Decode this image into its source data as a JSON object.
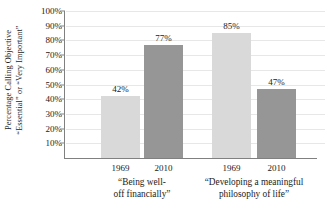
{
  "chart_data": {
    "type": "bar",
    "title": "",
    "subtitle": "",
    "xlabel": "",
    "ylabel_lines": [
      "Percentage Calling Objective",
      "“Essential” or “Very Important”"
    ],
    "ylim": [
      0,
      100
    ],
    "ytick_values": [
      100,
      90,
      80,
      70,
      60,
      50,
      40,
      30,
      20,
      10
    ],
    "ytick_labels": [
      "100%",
      "90%",
      "80%",
      "70%",
      "60%",
      "50%",
      "40%",
      "30%",
      "20%",
      "10%"
    ],
    "grid": true,
    "legend": "none",
    "categories": [
      {
        "lines": [
          "“Being well-",
          "off financially”"
        ],
        "text": "“Being well-off financially”"
      },
      {
        "lines": [
          "“Developing a meaningful",
          "philosophy of life”"
        ],
        "text": "“Developing a meaningful philosophy of life”"
      }
    ],
    "series": [
      {
        "name": "1969",
        "values": [
          42,
          85
        ],
        "color": "#d9d9d9"
      },
      {
        "name": "2010",
        "values": [
          77,
          47
        ],
        "color": "#969696"
      }
    ],
    "bars": [
      {
        "group": 0,
        "series": "1969",
        "value": 42,
        "label": "42%",
        "color": "#d9d9d9"
      },
      {
        "group": 0,
        "series": "2010",
        "value": 77,
        "label": "77%",
        "color": "#969696"
      },
      {
        "group": 1,
        "series": "1969",
        "value": 85,
        "label": "85%",
        "color": "#d9d9d9"
      },
      {
        "group": 1,
        "series": "2010",
        "value": 47,
        "label": "47%",
        "color": "#969696"
      }
    ],
    "xtick_labels": [
      "1969",
      "2010",
      "1969",
      "2010"
    ],
    "colors": {
      "axis": "#808080",
      "grid": "#e7e7e7",
      "text": "#1a1a1a",
      "background": "#ffffff"
    }
  }
}
